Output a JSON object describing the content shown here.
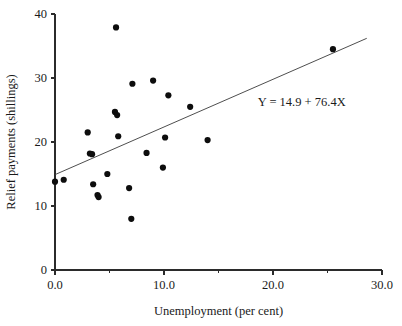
{
  "chart_data": {
    "type": "scatter",
    "title": "",
    "xlabel": "Unemployment (per cent)",
    "ylabel": "Relief payments (shillings)",
    "xlim": [
      0.0,
      30.0
    ],
    "ylim": [
      0,
      40
    ],
    "grid": false,
    "legend": "none",
    "x_ticks_major": [
      "0.0",
      "10.0",
      "20.0",
      "30.0"
    ],
    "x_tick_values_major": [
      0.0,
      10.0,
      20.0,
      30.0
    ],
    "x_tick_values_minor": [
      5.0,
      15.0,
      25.0
    ],
    "y_ticks_major": [
      "0",
      "10",
      "20",
      "30",
      "40"
    ],
    "y_tick_values_major": [
      0,
      10,
      20,
      30,
      40
    ],
    "points": [
      {
        "x": 0.0,
        "y": 13.8
      },
      {
        "x": 0.8,
        "y": 14.1
      },
      {
        "x": 3.0,
        "y": 21.5
      },
      {
        "x": 3.2,
        "y": 18.2
      },
      {
        "x": 3.4,
        "y": 18.1
      },
      {
        "x": 3.5,
        "y": 13.4
      },
      {
        "x": 3.9,
        "y": 11.7
      },
      {
        "x": 4.0,
        "y": 11.4
      },
      {
        "x": 4.8,
        "y": 15.0
      },
      {
        "x": 5.5,
        "y": 24.7
      },
      {
        "x": 5.6,
        "y": 37.9
      },
      {
        "x": 5.7,
        "y": 24.2
      },
      {
        "x": 5.8,
        "y": 20.9
      },
      {
        "x": 6.8,
        "y": 12.8
      },
      {
        "x": 7.0,
        "y": 8.0
      },
      {
        "x": 7.1,
        "y": 29.1
      },
      {
        "x": 8.4,
        "y": 18.3
      },
      {
        "x": 9.0,
        "y": 29.6
      },
      {
        "x": 9.9,
        "y": 16.0
      },
      {
        "x": 10.1,
        "y": 20.7
      },
      {
        "x": 10.4,
        "y": 27.3
      },
      {
        "x": 12.4,
        "y": 25.5
      },
      {
        "x": 14.0,
        "y": 20.3
      },
      {
        "x": 25.5,
        "y": 34.5
      }
    ],
    "fit_line": {
      "equation_label": "Y = 14.9 + 76.4X",
      "intercept": 14.9,
      "x_start": 0.0,
      "y_start": 14.9,
      "x_end": 28.6,
      "y_end": 36.2
    },
    "annotation": {
      "text": "Y = 14.9 + 76.4X",
      "x_data": 18.6,
      "y_data": 25.6
    },
    "colors": {
      "point": "#0d0d0d",
      "axis": "#2b2b2b",
      "fit_line": "#3a3a3a",
      "text": "#1a1a1a",
      "background": "#ffffff"
    }
  }
}
